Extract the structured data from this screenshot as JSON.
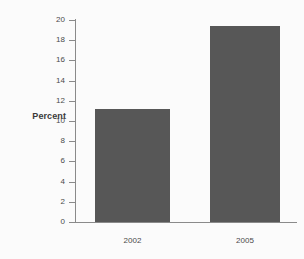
{
  "chart_data": {
    "type": "bar",
    "title": "",
    "subtitle": "",
    "xlabel": "",
    "ylabel": "Percent",
    "categories": [
      "2002",
      "2005"
    ],
    "values": [
      11.2,
      19.4
    ],
    "series": [
      {
        "name": "Percent",
        "values": [
          11.2,
          19.4
        ]
      }
    ],
    "ylim": [
      0,
      20
    ],
    "yticks": [
      0,
      2,
      4,
      6,
      8,
      10,
      12,
      14,
      16,
      18,
      20
    ],
    "ytick_labels": [
      "0",
      "2",
      "4",
      "6",
      "8",
      "10",
      "12",
      "14",
      "16",
      "18",
      "20"
    ],
    "grid": false,
    "legend": false,
    "legend_position": "none",
    "annotations": [],
    "colors": {
      "bar_fill": "#575757",
      "background": "#fbfbfb",
      "axis": "#8a8a8a",
      "tick_text": "#4a4a4a",
      "axis_title_text": "#3a3a3a"
    }
  }
}
